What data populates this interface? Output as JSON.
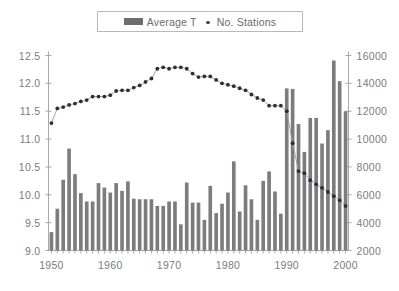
{
  "legend": {
    "entries": [
      {
        "label": "Average T",
        "marker": "bar-swatch-icon"
      },
      {
        "label": "No. Stations",
        "marker": "dot-marker-icon"
      }
    ]
  },
  "axes": {
    "left": {
      "ticks": [
        "12.5",
        "12.0",
        "11.5",
        "11.0",
        "10.5",
        "10.0",
        "9.5",
        "9.0"
      ],
      "min": 9.0,
      "max": 12.5
    },
    "right": {
      "ticks": [
        "16000",
        "14000",
        "12000",
        "10000",
        "8000",
        "6000",
        "4000",
        "2000"
      ],
      "min": 2000,
      "max": 16000
    },
    "bottom": {
      "ticks": [
        "1950",
        "1960",
        "1970",
        "1980",
        "1990",
        "2000"
      ]
    }
  },
  "chart_data": {
    "type": "bar",
    "title": "",
    "xlabel": "",
    "ylabel": "",
    "ylim": [
      9.0,
      12.5
    ],
    "y2lim": [
      2000,
      16000
    ],
    "grid": false,
    "legend_position": "top-center",
    "categories": [
      1950,
      1951,
      1952,
      1953,
      1954,
      1955,
      1956,
      1957,
      1958,
      1959,
      1960,
      1961,
      1962,
      1963,
      1964,
      1965,
      1966,
      1967,
      1968,
      1969,
      1970,
      1971,
      1972,
      1973,
      1974,
      1975,
      1976,
      1977,
      1978,
      1979,
      1980,
      1981,
      1982,
      1983,
      1984,
      1985,
      1986,
      1987,
      1988,
      1989,
      1990,
      1991,
      1992,
      1993,
      1994,
      1995,
      1996,
      1997,
      1998,
      1999,
      2000
    ],
    "series": [
      {
        "name": "Average T",
        "type": "bar",
        "axis": "left",
        "values": [
          9.33,
          9.75,
          10.27,
          10.83,
          10.37,
          10.03,
          9.88,
          9.88,
          10.21,
          10.13,
          10.04,
          10.21,
          10.07,
          10.24,
          9.93,
          9.92,
          9.92,
          9.92,
          9.8,
          9.8,
          9.88,
          9.88,
          9.47,
          10.22,
          9.86,
          9.86,
          9.55,
          10.16,
          9.67,
          9.84,
          10.04,
          10.6,
          9.7,
          10.17,
          9.92,
          9.55,
          10.25,
          10.42,
          10.06,
          9.66,
          11.91,
          11.9,
          11.27,
          10.77,
          11.38,
          11.38,
          10.92,
          11.16,
          12.41,
          12.04,
          11.5
        ]
      },
      {
        "name": "No. Stations",
        "type": "line",
        "axis": "right",
        "values": [
          11150,
          12200,
          12300,
          12450,
          12550,
          12700,
          12800,
          13050,
          13050,
          13050,
          13150,
          13450,
          13500,
          13500,
          13700,
          13850,
          14100,
          14350,
          15050,
          15150,
          15050,
          15150,
          15150,
          15050,
          14700,
          14450,
          14500,
          14500,
          14250,
          14000,
          13900,
          13800,
          13650,
          13500,
          13200,
          12950,
          12800,
          12400,
          12400,
          12400,
          12000,
          9700,
          7700,
          7550,
          7050,
          6750,
          6500,
          6200,
          5900,
          5600,
          5200
        ]
      }
    ]
  }
}
